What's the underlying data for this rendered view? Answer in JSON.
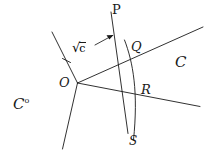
{
  "figure": {
    "type": "geometry-diagram",
    "background_color": "#ffffff",
    "stroke_color": "#1a1a1a",
    "text_color": "#1a1a1a",
    "labels": {
      "apex": "O",
      "point_p": "P",
      "point_q": "Q",
      "point_r": "R",
      "point_s": "S",
      "cone": "C",
      "polar_cone_base": "C",
      "polar_cone_sup": "o",
      "distance_radical": "√",
      "distance_value": "c"
    },
    "geometry": {
      "apex_xy": [
        77,
        83
      ],
      "point_p_xy": [
        113,
        22
      ],
      "point_q_xy": [
        126,
        50
      ],
      "point_r_xy": [
        136,
        92
      ],
      "point_s_xy": [
        128,
        133
      ],
      "ray_upper_left_end": [
        52,
        32
      ],
      "ray_lower_left_end": [
        62,
        149
      ],
      "ray_upper_right_end": [
        203,
        27
      ],
      "ray_lower_right_end": [
        200,
        106
      ],
      "arrow_tail_xy": [
        96,
        43
      ],
      "arrow_head_xy": [
        113,
        35
      ]
    }
  }
}
